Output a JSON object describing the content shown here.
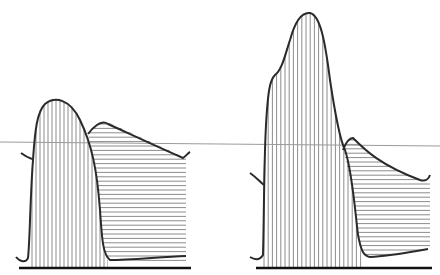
{
  "diagram": {
    "panels": [
      {
        "name": "left",
        "systolic_hatch": "vertical",
        "diastolic_hatch": "horizontal"
      },
      {
        "name": "right",
        "systolic_hatch": "vertical",
        "diastolic_hatch": "horizontal"
      }
    ],
    "colors": {
      "curve": "#2a2a2a",
      "hatch": "#6f6f6f",
      "reference_line": "#9a9a9a",
      "baseline": "#111111"
    }
  }
}
